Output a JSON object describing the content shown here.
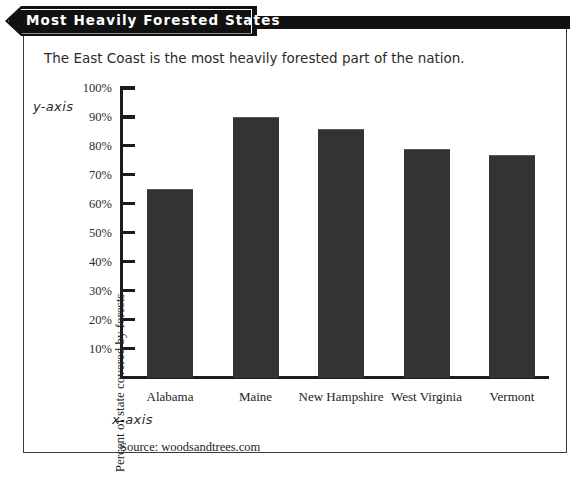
{
  "banner": {
    "title": "Most Heavily Forested States"
  },
  "subtitle": "The East Coast is the most heavily forested part of the nation.",
  "annotations": {
    "y_axis": "y-axis",
    "x_axis": "x-axis"
  },
  "source": "Source: woodsandtrees.com",
  "colors": {
    "bar": "#333333",
    "axis": "#1c1c1c",
    "banner": "#111111",
    "frame": "#3a3a3a",
    "text": "#232323"
  },
  "chart_data": {
    "type": "bar",
    "title": "Most Heavily Forested States",
    "subtitle": "The East Coast is the most heavily forested part of the nation.",
    "categories": [
      "Alabama",
      "Maine",
      "New Hampshire",
      "West Virginia",
      "Vermont"
    ],
    "values": [
      65,
      90,
      86,
      79,
      77
    ],
    "xlabel": "",
    "ylabel": "Percent of state covered by forests",
    "ylim": [
      0,
      100
    ],
    "ytick_labels": [
      "10%",
      "20%",
      "30%",
      "40%",
      "50%",
      "60%",
      "70%",
      "80%",
      "90%",
      "100%"
    ],
    "ytick_values": [
      10,
      20,
      30,
      40,
      50,
      60,
      70,
      80,
      90,
      100
    ],
    "grid": false,
    "legend": null,
    "source": "Source: woodsandtrees.com"
  }
}
